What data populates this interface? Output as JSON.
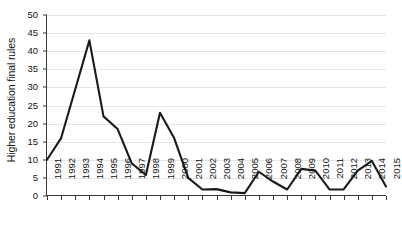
{
  "chart_data": {
    "type": "line",
    "title": "",
    "subtitle": "",
    "xlabel": "",
    "ylabel": "Higher education final rules",
    "ylim": [
      0,
      50
    ],
    "ytick_step": 5,
    "yticks": [
      0,
      5,
      10,
      15,
      20,
      25,
      30,
      35,
      40,
      45,
      50
    ],
    "ytick_labels": [
      "0",
      "5",
      "10",
      "15",
      "20",
      "25",
      "30",
      "35",
      "40",
      "45",
      "50"
    ],
    "grid": true,
    "grid_axis": "y",
    "legend": false,
    "legend_position": "none",
    "line_color": "#1a1a1a",
    "grid_color": "#e6e6e6",
    "axis_color": "#3a3a3a",
    "background_color": "#ffffff",
    "markers": false,
    "categories": [
      "1991",
      "1992",
      "1993",
      "1994",
      "1995",
      "1996",
      "1997",
      "1998",
      "1999",
      "2000",
      "2001",
      "2002",
      "2003",
      "2004",
      "2005",
      "2006",
      "2007",
      "2008",
      "2009",
      "2010",
      "2011",
      "2012",
      "2013",
      "2014",
      "2015"
    ],
    "values": [
      10.0,
      16.0,
      29.5,
      43.0,
      22.0,
      18.5,
      9.0,
      5.8,
      23.0,
      16.0,
      5.0,
      1.8,
      1.9,
      1.0,
      0.8,
      6.7,
      4.0,
      1.8,
      7.5,
      7.0,
      1.8,
      1.8,
      7.0,
      9.7,
      2.6
    ],
    "series": [
      {
        "name": "Higher education final rules",
        "values": [
          10.0,
          16.0,
          29.5,
          43.0,
          22.0,
          18.5,
          9.0,
          5.8,
          23.0,
          16.0,
          5.0,
          1.8,
          1.9,
          1.0,
          0.8,
          6.7,
          4.0,
          1.8,
          7.5,
          7.0,
          1.8,
          1.8,
          7.0,
          9.7,
          2.6
        ]
      }
    ]
  }
}
